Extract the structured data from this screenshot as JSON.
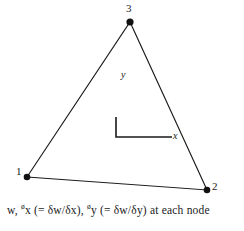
{
  "figure": {
    "background_color": "#ffffff",
    "stroke_color": "#1a1a1a",
    "element_type": "triangular plate bending element"
  },
  "nodes": [
    {
      "id": "1",
      "label": "1",
      "x": 27,
      "y": 177,
      "label_x": 16,
      "label_y": 171
    },
    {
      "id": "2",
      "label": "2",
      "x": 207,
      "y": 190,
      "label_x": 212,
      "label_y": 185
    },
    {
      "id": "3",
      "label": "3",
      "x": 130,
      "y": 22,
      "label_x": 126,
      "label_y": 5
    }
  ],
  "axes": {
    "origin_x": 116,
    "origin_y": 137,
    "y_top": 117,
    "x_right": 56,
    "x_label": "x",
    "y_label": "y",
    "x_label_x": 173,
    "x_label_y": 133,
    "y_label_x": 121,
    "y_label_y": 73
  },
  "caption": {
    "full_text": "w, øx (= δw/δx), øy (= δw/δy) at each node",
    "part_w": "w, ",
    "sup_1": "ø",
    "var_1": "x",
    "paren_1": " (= δw/δx), ",
    "sup_2": "ø",
    "var_2": "y",
    "paren_2": " (= δw/δy) ",
    "tail": "at each node"
  }
}
